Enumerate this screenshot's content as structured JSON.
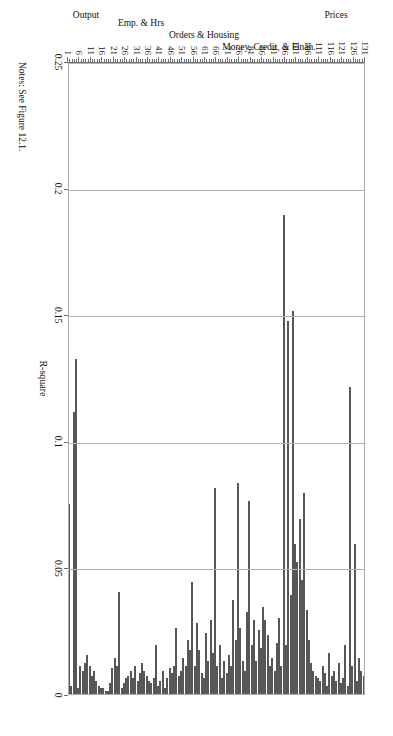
{
  "figure": {
    "notes": "Notes: See Figure 12.1.",
    "bar_color": "#8a8a8a",
    "bar_border_color": "#575757",
    "grid_color": "#b4b4b4",
    "axis_color": "#6e6e6e"
  },
  "chart_data": {
    "type": "bar",
    "orientation": "horizontal",
    "title": "",
    "xlabel": "R-square",
    "ylabel": "",
    "xlim": [
      0,
      0.25
    ],
    "ylim": [
      1,
      131
    ],
    "grid": true,
    "legend": null,
    "value_ticks": [
      "0",
      "0.05",
      "0.1",
      "0.15",
      "0.2",
      "0.25"
    ],
    "value_tick_values": [
      0,
      0.05,
      0.1,
      0.15,
      0.2,
      0.25
    ],
    "category_ticks": [
      1,
      6,
      11,
      16,
      21,
      26,
      31,
      36,
      41,
      46,
      51,
      56,
      61,
      66,
      71,
      76,
      81,
      86,
      91,
      96,
      101,
      106,
      111,
      116,
      121,
      126,
      131
    ],
    "groups": [
      {
        "label": "Output",
        "start": 1,
        "end": 17
      },
      {
        "label": "Emp. & Hrs",
        "start": 18,
        "end": 48
      },
      {
        "label": "Orders & Housing",
        "start": 49,
        "end": 72
      },
      {
        "label": "Money, Credit, & Finan.",
        "start": 73,
        "end": 105
      },
      {
        "label": "Prices",
        "start": 106,
        "end": 131
      }
    ],
    "categories": [
      1,
      2,
      3,
      4,
      5,
      6,
      7,
      8,
      9,
      10,
      11,
      12,
      13,
      14,
      15,
      16,
      17,
      18,
      19,
      20,
      21,
      22,
      23,
      24,
      25,
      26,
      27,
      28,
      29,
      30,
      31,
      32,
      33,
      34,
      35,
      36,
      37,
      38,
      39,
      40,
      41,
      42,
      43,
      44,
      45,
      46,
      47,
      48,
      49,
      50,
      51,
      52,
      53,
      54,
      55,
      56,
      57,
      58,
      59,
      60,
      61,
      62,
      63,
      64,
      65,
      66,
      67,
      68,
      69,
      70,
      71,
      72,
      73,
      74,
      75,
      76,
      77,
      78,
      79,
      80,
      81,
      82,
      83,
      84,
      85,
      86,
      87,
      88,
      89,
      90,
      91,
      92,
      93,
      94,
      95,
      96,
      97,
      98,
      99,
      100,
      101,
      102,
      103,
      104,
      105,
      106,
      107,
      108,
      109,
      110,
      111,
      112,
      113,
      114,
      115,
      116,
      117,
      118,
      119,
      120,
      121,
      122,
      123,
      124,
      125,
      126,
      127,
      128,
      129,
      130,
      131
    ],
    "values": [
      0.006,
      0.076,
      0.004,
      0.112,
      0.133,
      0.003,
      0.012,
      0.01,
      0.013,
      0.016,
      0.012,
      0.008,
      0.01,
      0.006,
      0.004,
      0.003,
      0.003,
      0.002,
      0.002,
      0.005,
      0.011,
      0.015,
      0.012,
      0.041,
      0.003,
      0.005,
      0.007,
      0.008,
      0.01,
      0.007,
      0.012,
      0.006,
      0.009,
      0.013,
      0.01,
      0.008,
      0.006,
      0.005,
      0.007,
      0.02,
      0.004,
      0.006,
      0.01,
      0.003,
      0.007,
      0.011,
      0.009,
      0.012,
      0.027,
      0.008,
      0.01,
      0.015,
      0.012,
      0.022,
      0.018,
      0.045,
      0.012,
      0.029,
      0.018,
      0.009,
      0.007,
      0.025,
      0.014,
      0.03,
      0.017,
      0.082,
      0.012,
      0.02,
      0.007,
      0.014,
      0.009,
      0.016,
      0.012,
      0.038,
      0.022,
      0.084,
      0.027,
      0.014,
      0.01,
      0.033,
      0.077,
      0.02,
      0.03,
      0.014,
      0.026,
      0.019,
      0.035,
      0.03,
      0.024,
      0.012,
      0.015,
      0.01,
      0.021,
      0.031,
      0.012,
      0.19,
      0.02,
      0.148,
      0.04,
      0.152,
      0.06,
      0.053,
      0.07,
      0.046,
      0.08,
      0.034,
      0.022,
      0.013,
      0.01,
      0.008,
      0.007,
      0.006,
      0.012,
      0.009,
      0.004,
      0.017,
      0.008,
      0.01,
      0.006,
      0.013,
      0.005,
      0.007,
      0.02,
      0.004,
      0.122,
      0.012,
      0.06,
      0.006,
      0.015,
      0.01,
      0.008
    ]
  }
}
